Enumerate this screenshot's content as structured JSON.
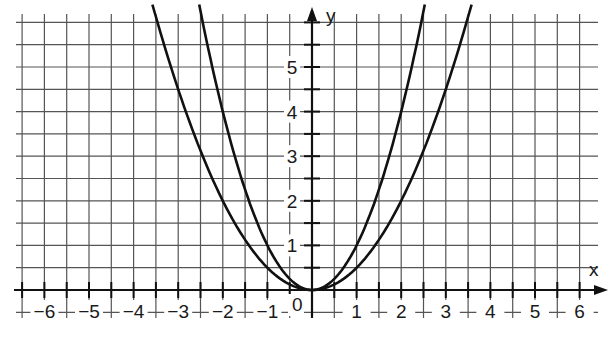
{
  "chart_data": {
    "type": "line",
    "title": "",
    "xlabel": "x",
    "ylabel": "y",
    "xlim": [
      -6.5,
      6.5
    ],
    "ylim": [
      -0.5,
      6.4
    ],
    "grid": true,
    "grid_step": 0.5,
    "origin_label": "0",
    "x_ticks": [
      -6,
      -5,
      -4,
      -3,
      -2,
      -1,
      1,
      2,
      3,
      4,
      5,
      6
    ],
    "x_tick_labels": [
      "−6",
      "−5",
      "−4",
      "−3",
      "−2",
      "−1",
      "1",
      "2",
      "3",
      "4",
      "5",
      "6"
    ],
    "y_ticks": [
      1,
      2,
      3,
      4,
      5
    ],
    "y_tick_labels": [
      "1",
      "2",
      "3",
      "4",
      "5"
    ],
    "legend": [],
    "series": [
      {
        "name": "y = x²",
        "coef": 1,
        "x": [
          -2.5,
          -2,
          -1.5,
          -1,
          -0.5,
          0,
          0.5,
          1,
          1.5,
          2,
          2.5
        ],
        "y": [
          6.25,
          4,
          2.25,
          1,
          0.25,
          0,
          0.25,
          1,
          2.25,
          4,
          6.25
        ]
      },
      {
        "name": "y = 0.5x²",
        "coef": 0.5,
        "x": [
          -3.5,
          -3,
          -2,
          -1,
          0,
          1,
          2,
          3,
          3.5
        ],
        "y": [
          6.125,
          4.5,
          2,
          0.5,
          0,
          0.5,
          2,
          4.5,
          6.125
        ]
      }
    ]
  }
}
